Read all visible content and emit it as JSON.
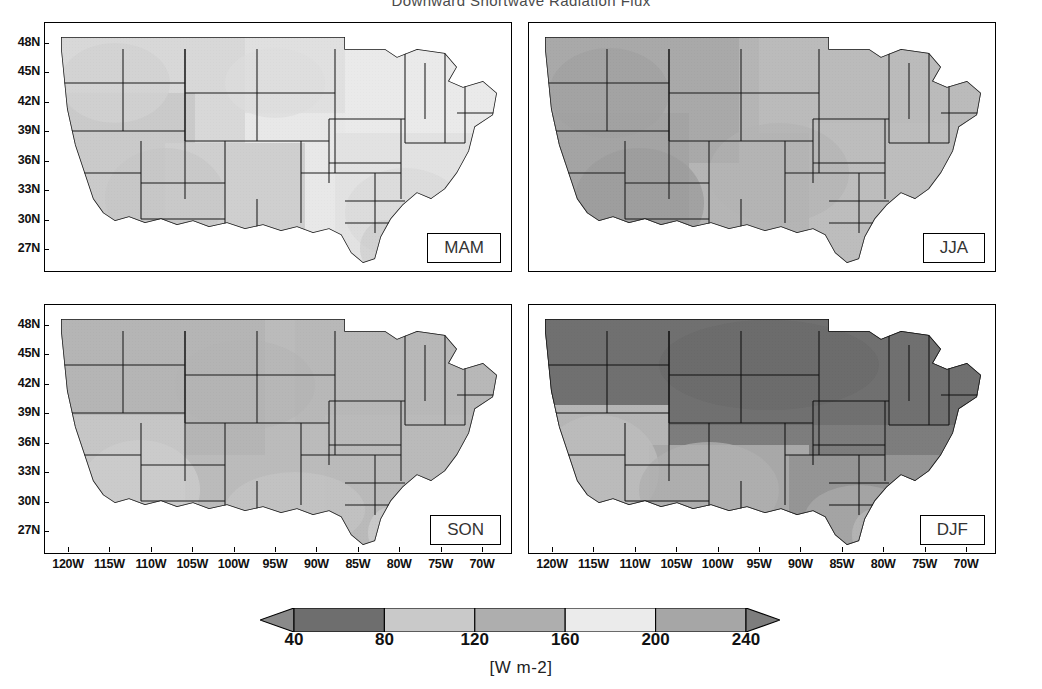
{
  "figure": {
    "title": "Downward Shortwave Radiation Flux",
    "units_label": "[W m-2]"
  },
  "axes": {
    "ylabels": [
      "48N",
      "45N",
      "42N",
      "39N",
      "36N",
      "33N",
      "30N",
      "27N"
    ],
    "xlabels": [
      "120W",
      "115W",
      "110W",
      "105W",
      "100W",
      "95W",
      "90W",
      "85W",
      "80W",
      "75W",
      "70W"
    ]
  },
  "panels": [
    {
      "key": "mam",
      "label": "MAM"
    },
    {
      "key": "jja",
      "label": "JJA"
    },
    {
      "key": "son",
      "label": "SON"
    },
    {
      "key": "djf",
      "label": "DJF"
    }
  ],
  "colorbar": {
    "ticks": [
      40,
      80,
      120,
      160,
      200,
      240
    ],
    "tick_labels": [
      "40",
      "80",
      "120",
      "160",
      "200",
      "240"
    ],
    "extend": "both",
    "swatches": [
      "#8a8a8a",
      "#6e6e6e",
      "#c9c9c9",
      "#aeaeae",
      "#ebebeb",
      "#a6a6a6",
      "#7d7d7d"
    ]
  },
  "chart_data": {
    "type": "heatmap",
    "title": "Downward Shortwave Radiation Flux",
    "subtitle": "",
    "xlabel": "",
    "ylabel": "",
    "units": "W m-2",
    "region": "Contiguous United States",
    "projection": "cylindrical equidistant",
    "xlim": [
      -125,
      -66
    ],
    "ylim": [
      25,
      50
    ],
    "xticks": [
      -120,
      -115,
      -110,
      -105,
      -100,
      -95,
      -90,
      -85,
      -80,
      -75,
      -70
    ],
    "xtick_labels": [
      "120W",
      "115W",
      "110W",
      "105W",
      "100W",
      "95W",
      "90W",
      "85W",
      "80W",
      "75W",
      "70W"
    ],
    "yticks": [
      48,
      45,
      42,
      39,
      36,
      33,
      30,
      27
    ],
    "ytick_labels": [
      "48N",
      "45N",
      "42N",
      "39N",
      "36N",
      "33N",
      "30N",
      "27N"
    ],
    "grid": false,
    "legend_position": "bottom",
    "colorbar": {
      "levels": [
        40,
        80,
        120,
        160,
        200,
        240
      ],
      "vmin": 0,
      "vmax": 280,
      "extend": "both",
      "cmap": "grayscale-banded"
    },
    "panels": [
      {
        "name": "MAM",
        "season": "March-April-May",
        "summary": "Broad 160-200 W m-2 over most of the CONUS; highest values over the desert Southwest, lower 120-160 over the Pacific Northwest and Appalachians.",
        "regional_values": [
          {
            "region": "Pacific Northwest",
            "value": 150
          },
          {
            "region": "Northern Rockies",
            "value": 170
          },
          {
            "region": "Desert Southwest",
            "value": 215
          },
          {
            "region": "Great Plains",
            "value": 185
          },
          {
            "region": "Midwest",
            "value": 175
          },
          {
            "region": "Northeast",
            "value": 160
          },
          {
            "region": "Southeast",
            "value": 185
          },
          {
            "region": "Florida",
            "value": 200
          }
        ]
      },
      {
        "name": "JJA",
        "season": "June-July-August",
        "summary": "Highest seasonal fluxes; 240-280 W m-2 over the western interior and Southwest, 200-240 across the eastern half.",
        "regional_values": [
          {
            "region": "Pacific Northwest",
            "value": 250
          },
          {
            "region": "Northern Rockies",
            "value": 260
          },
          {
            "region": "Desert Southwest",
            "value": 265
          },
          {
            "region": "Great Plains",
            "value": 245
          },
          {
            "region": "Midwest",
            "value": 230
          },
          {
            "region": "Northeast",
            "value": 220
          },
          {
            "region": "Southeast",
            "value": 225
          },
          {
            "region": "Florida",
            "value": 225
          }
        ]
      },
      {
        "name": "SON",
        "season": "September-October-November",
        "summary": "Moderate fluxes near 120-160 W m-2 nationwide, with 160-200 over southern Florida, south Texas and the Southwest.",
        "regional_values": [
          {
            "region": "Pacific Northwest",
            "value": 120
          },
          {
            "region": "Northern Rockies",
            "value": 140
          },
          {
            "region": "Desert Southwest",
            "value": 175
          },
          {
            "region": "Great Plains",
            "value": 150
          },
          {
            "region": "Midwest",
            "value": 140
          },
          {
            "region": "Northeast",
            "value": 125
          },
          {
            "region": "Southeast",
            "value": 160
          },
          {
            "region": "Florida",
            "value": 180
          }
        ]
      },
      {
        "name": "DJF",
        "season": "December-January-February",
        "summary": "Lowest seasonal fluxes; 40-80 W m-2 across the northern tier and Great Lakes, increasing to 120-160 over the Southwest, Gulf Coast and Florida.",
        "regional_values": [
          {
            "region": "Pacific Northwest",
            "value": 60
          },
          {
            "region": "Northern Rockies",
            "value": 65
          },
          {
            "region": "Desert Southwest",
            "value": 135
          },
          {
            "region": "Great Plains",
            "value": 85
          },
          {
            "region": "Midwest",
            "value": 65
          },
          {
            "region": "Northeast",
            "value": 70
          },
          {
            "region": "Southeast",
            "value": 115
          },
          {
            "region": "Florida",
            "value": 150
          }
        ]
      }
    ]
  }
}
